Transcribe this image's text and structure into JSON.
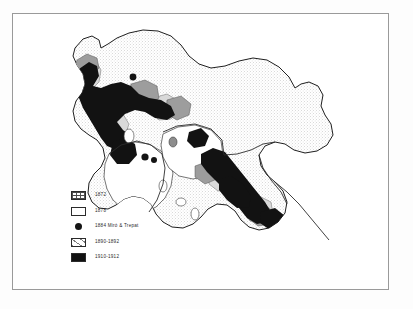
{
  "figure": {
    "kind": "scanned-thematic-map",
    "background_color": "#ffffff",
    "frame_color": "#9a9a9a"
  },
  "map": {
    "name": "regional-outline-map",
    "description": "Outline map of a region with stippled interior and shaded diffusion zones",
    "outline_color": "#1f1f1f",
    "interior_fill": "stipple",
    "zone_dark_color": "#121212",
    "zone_mid_color": "#8d8d8d",
    "zone_light_color": "#d9d9d9",
    "point_markers": [
      {
        "name": "marker-north",
        "cx": 120,
        "cy": 63,
        "r": 3.4
      },
      {
        "name": "marker-central",
        "cx": 132,
        "cy": 143,
        "r": 3.6
      },
      {
        "name": "marker-central-east",
        "cx": 141,
        "cy": 146,
        "r": 3.0
      }
    ]
  },
  "legend": {
    "name": "map-legend",
    "entries": [
      {
        "swatch": "hatched-1872",
        "label": "1872"
      },
      {
        "swatch": "stippled-1878",
        "label": "1878"
      },
      {
        "swatch": "dot-marker",
        "label": "1884  Miró & Trepat"
      },
      {
        "swatch": "light-1890",
        "label": "1890-1892"
      },
      {
        "swatch": "solid-1910",
        "label": "1910-1912"
      }
    ]
  },
  "colors": {
    "ink": "#1f1f1f",
    "dark_zone": "#121212",
    "mid_zone": "#8d8d8d",
    "light_zone": "#d9d9d9",
    "frame": "#9a9a9a",
    "paper": "#ffffff"
  }
}
